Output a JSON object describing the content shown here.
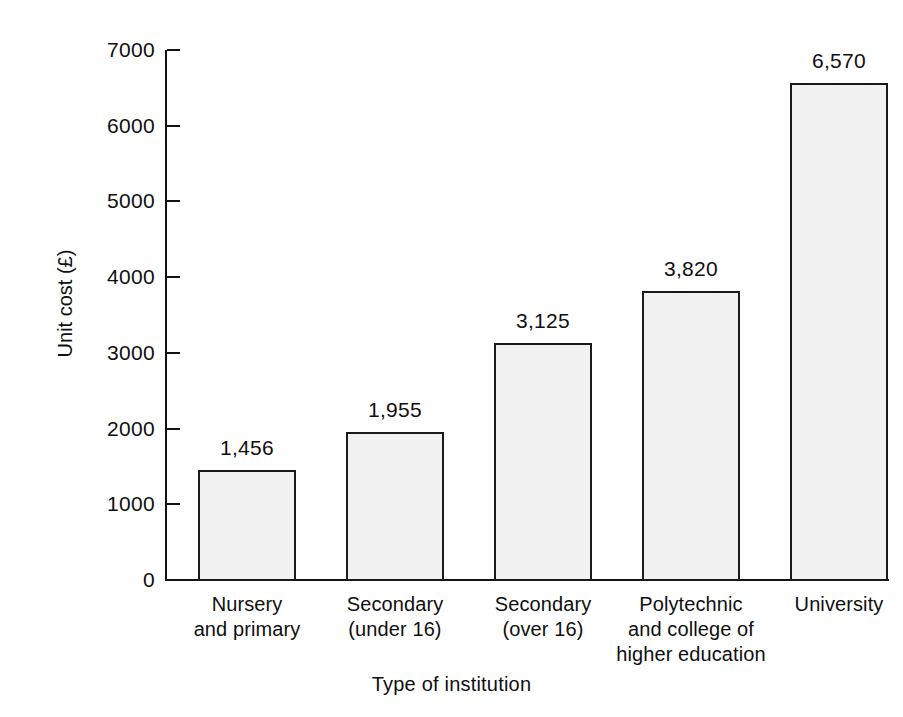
{
  "chart_data": {
    "type": "bar",
    "title": "",
    "subtitle": "",
    "xlabel": "Type of institution",
    "ylabel": "Unit cost (£)",
    "categories": [
      "Nursery\nand primary",
      "Secondary\n(under 16)",
      "Secondary\n(over 16)",
      "Polytechnic\nand college of\nhigher education",
      "University"
    ],
    "category_lines": [
      [
        "Nursery",
        "and primary"
      ],
      [
        "Secondary",
        "(under 16)"
      ],
      [
        "Secondary",
        "(over 16)"
      ],
      [
        "Polytechnic",
        "and college of",
        "higher education"
      ],
      [
        "University"
      ]
    ],
    "values": [
      1456,
      1955,
      3125,
      3820,
      6570
    ],
    "value_labels": [
      "1,456",
      "1,955",
      "3,125",
      "3,820",
      "6,570"
    ],
    "ylim": [
      0,
      7000
    ],
    "yticks": [
      0,
      1000,
      2000,
      3000,
      4000,
      5000,
      6000,
      7000
    ],
    "ytick_labels": [
      "0",
      "1000",
      "2000",
      "3000",
      "4000",
      "5000",
      "6000",
      "7000"
    ],
    "grid": false,
    "legend": false,
    "legend_position": "none",
    "bar_fill_color": "#f1f1f1",
    "bar_stroke_color": "#1a1a1a",
    "axis_color": "#131313",
    "background_color": "#ffffff",
    "text_color": "#0f0f0f"
  }
}
